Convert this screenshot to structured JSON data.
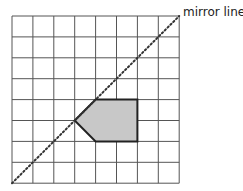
{
  "diagram": {
    "mirror_label": "mirror line",
    "grid": {
      "columns": 8,
      "rows": 8
    },
    "mirror_line": {
      "from": [
        0,
        8
      ],
      "to": [
        8,
        0
      ],
      "style": "dotted"
    },
    "shape": {
      "name": "pentagon",
      "vertices": [
        [
          3,
          5
        ],
        [
          4,
          4
        ],
        [
          6,
          4
        ],
        [
          6,
          6
        ],
        [
          4,
          6
        ]
      ],
      "fill": "#c8c8c8",
      "stroke": "#222222"
    },
    "colors": {
      "grid_line": "#555555",
      "mirror_line": "#333333"
    }
  }
}
